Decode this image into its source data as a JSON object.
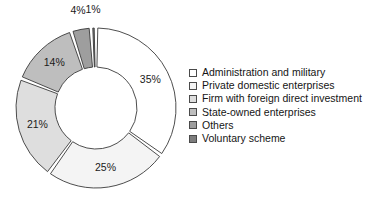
{
  "chart_data": {
    "type": "pie",
    "variant": "donut-exploded",
    "title": "",
    "subtitle": "",
    "xlabel": "",
    "ylabel": "",
    "grid": false,
    "legend_position": "right",
    "units": "percent",
    "start_angle_deg": 0,
    "direction": "clockwise",
    "categories": [
      "Administration and military",
      "Private domestic enterprises",
      "Firm with foreign direct investment",
      "State-owned enterprises",
      "Others",
      "Voluntary scheme"
    ],
    "values": [
      35,
      25,
      21,
      14,
      4,
      1
    ],
    "data_labels": [
      "35%",
      "25%",
      "21%",
      "14%",
      "4%",
      "1%"
    ],
    "colors": [
      "#ffffff",
      "#f4f4f4",
      "#dedede",
      "#bebebe",
      "#9e9e9e",
      "#7d7d7d"
    ],
    "slice_outline_color": "#3a3a3a",
    "background_color": "#ffffff"
  },
  "geometry": {
    "center_x": 96,
    "center_y": 108,
    "outer_radius": 80,
    "inner_radius": 41,
    "explode_gap_deg": 2.6,
    "label_radius": 61,
    "external_label_radius": 96
  },
  "legend": {
    "items": [
      {
        "label": "Administration and military",
        "swatch": "#ffffff"
      },
      {
        "label": "Private domestic enterprises",
        "swatch": "#f4f4f4"
      },
      {
        "label": "Firm with foreign direct investment",
        "swatch": "#dedede"
      },
      {
        "label": "State-owned enterprises",
        "swatch": "#bebebe"
      },
      {
        "label": "Others",
        "swatch": "#9e9e9e"
      },
      {
        "label": "Voluntary scheme",
        "swatch": "#7d7d7d"
      }
    ]
  }
}
